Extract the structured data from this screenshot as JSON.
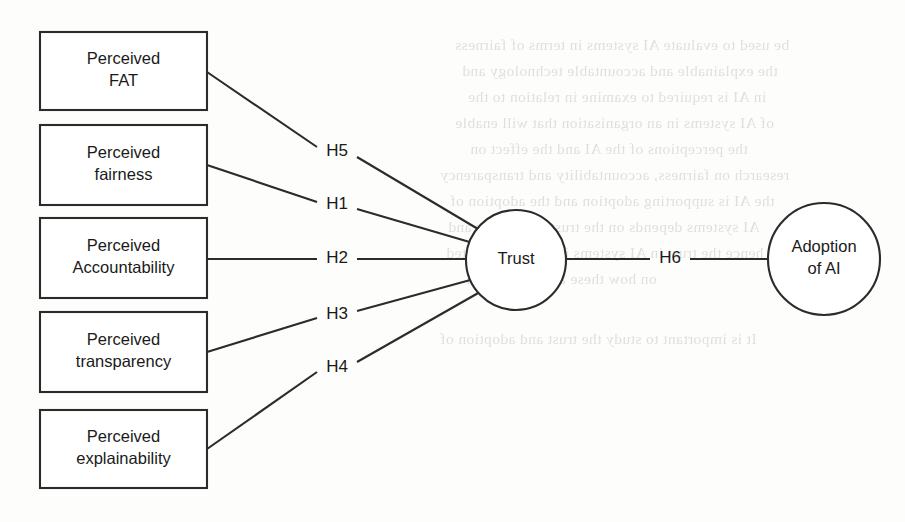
{
  "diagram": {
    "type": "path-model",
    "colors": {
      "background": "#fdfdfb",
      "stroke": "#2b2b2b",
      "node_fill": "#ffffff",
      "text": "#1a1a1a",
      "ghost_text": "#d9d6d0"
    },
    "exogenous_boxes": [
      {
        "id": "fat",
        "line1": "Perceived",
        "line2": "FAT",
        "x": 40,
        "y": 32,
        "w": 167,
        "h": 78
      },
      {
        "id": "fairness",
        "line1": "Perceived",
        "line2": "fairness",
        "x": 40,
        "y": 125,
        "w": 167,
        "h": 80
      },
      {
        "id": "accountability",
        "line1": "Perceived",
        "line2": "Accountability",
        "x": 40,
        "y": 218,
        "w": 167,
        "h": 80
      },
      {
        "id": "transparency",
        "line1": "Perceived",
        "line2": "transparency",
        "x": 40,
        "y": 312,
        "w": 167,
        "h": 80
      },
      {
        "id": "explainability",
        "line1": "Perceived",
        "line2": "explainability",
        "x": 40,
        "y": 410,
        "w": 167,
        "h": 78
      }
    ],
    "circles": [
      {
        "id": "trust",
        "line1": "Trust",
        "line2": "",
        "cx": 516,
        "cy": 260,
        "r": 50
      },
      {
        "id": "adoption",
        "line1": "Adoption",
        "line2": "of AI",
        "cx": 824,
        "cy": 259,
        "r": 56
      }
    ],
    "hypotheses": [
      {
        "id": "h5",
        "label": "H5",
        "from": "fat",
        "to": "trust",
        "lx": 337,
        "ly": 152
      },
      {
        "id": "h1",
        "label": "H1",
        "from": "fairness",
        "to": "trust",
        "lx": 337,
        "ly": 205
      },
      {
        "id": "h2",
        "label": "H2",
        "from": "accountability",
        "to": "trust",
        "lx": 337,
        "ly": 259
      },
      {
        "id": "h3",
        "label": "H3",
        "from": "transparency",
        "to": "trust",
        "lx": 337,
        "ly": 315
      },
      {
        "id": "h4",
        "label": "H4",
        "from": "explainability",
        "to": "trust",
        "lx": 337,
        "ly": 368
      },
      {
        "id": "h6",
        "label": "H6",
        "from": "trust",
        "to": "adoption",
        "lx": 670,
        "ly": 259
      }
    ],
    "edges": [
      {
        "id": "e-h5-a",
        "x1": 207,
        "y1": 72,
        "x2": 317,
        "y2": 147
      },
      {
        "id": "e-h5-b",
        "x1": 357,
        "y1": 157,
        "x2": 478,
        "y2": 229
      },
      {
        "id": "e-h1-a",
        "x1": 207,
        "y1": 165,
        "x2": 317,
        "y2": 202
      },
      {
        "id": "e-h1-b",
        "x1": 357,
        "y1": 209,
        "x2": 473,
        "y2": 243
      },
      {
        "id": "e-h2-a",
        "x1": 207,
        "y1": 259,
        "x2": 317,
        "y2": 259
      },
      {
        "id": "e-h2-b",
        "x1": 357,
        "y1": 259,
        "x2": 466,
        "y2": 259
      },
      {
        "id": "e-h3-a",
        "x1": 207,
        "y1": 352,
        "x2": 317,
        "y2": 318
      },
      {
        "id": "e-h3-b",
        "x1": 357,
        "y1": 311,
        "x2": 474,
        "y2": 279
      },
      {
        "id": "e-h4-a",
        "x1": 207,
        "y1": 449,
        "x2": 317,
        "y2": 372
      },
      {
        "id": "e-h4-b",
        "x1": 357,
        "y1": 362,
        "x2": 480,
        "y2": 292
      },
      {
        "id": "e-h6-a",
        "x1": 566,
        "y1": 259,
        "x2": 650,
        "y2": 259
      },
      {
        "id": "e-h6-b",
        "x1": 690,
        "y1": 259,
        "x2": 768,
        "y2": 259
      }
    ]
  },
  "background_ghost": {
    "note": "faint mirrored show-through text from the reverse side of the scanned page",
    "lines": [
      {
        "text": "be used to evaluate AI systems in terms of fairness",
        "x": 455,
        "y": 36,
        "size": 15.5
      },
      {
        "text": "the explainable and accountable technology and",
        "x": 462,
        "y": 62,
        "size": 15.5
      },
      {
        "text": "in AI is required to examine in relation to the",
        "x": 468,
        "y": 88,
        "size": 15.5
      },
      {
        "text": "of AI systems in an organisation that will enable",
        "x": 455,
        "y": 114,
        "size": 15.5
      },
      {
        "text": "the perceptions of the AI and the effect on",
        "x": 470,
        "y": 140,
        "size": 15.5
      },
      {
        "text": "research on fairness, accountability and transparency",
        "x": 440,
        "y": 166,
        "size": 15.5
      },
      {
        "text": "the AI is supporting adoption and the adoption of",
        "x": 450,
        "y": 192,
        "size": 15.5
      },
      {
        "text": "AI systems depends on the trust of the user and",
        "x": 448,
        "y": 218,
        "size": 15.5
      },
      {
        "text": "hence the trust in AI systems is directly affected",
        "x": 446,
        "y": 244,
        "size": 15.5
      },
      {
        "text": "on how these are designed in",
        "x": 466,
        "y": 270,
        "size": 15.5
      },
      {
        "text": "It is important to study the trust and adoption of",
        "x": 440,
        "y": 330,
        "size": 15.5
      }
    ]
  }
}
